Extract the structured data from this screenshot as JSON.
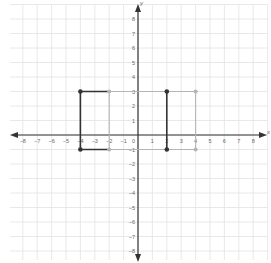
{
  "chart_data": {
    "type": "scatter",
    "title": "",
    "xlabel": "x",
    "ylabel": "y",
    "xlim": [
      -9,
      9
    ],
    "ylim": [
      -9,
      9
    ],
    "grid": true,
    "x_ticks": [
      -8,
      -7,
      -6,
      -5,
      -4,
      -3,
      -2,
      -1,
      1,
      2,
      3,
      4,
      5,
      6,
      7,
      8
    ],
    "y_ticks": [
      -8,
      -7,
      -6,
      -5,
      -4,
      -3,
      -2,
      -1,
      1,
      2,
      3,
      4,
      5,
      6,
      7,
      8
    ],
    "origin_label": "0",
    "series": [
      {
        "name": "Rectangle A (gray)",
        "style": "light",
        "color": "#b5b5b5",
        "closed": true,
        "points": [
          [
            -4,
            3
          ],
          [
            4,
            3
          ],
          [
            4,
            -1
          ],
          [
            -4,
            -1
          ]
        ]
      },
      {
        "name": "Inner vertical edge x=-2",
        "style": "light",
        "color": "#b5b5b5",
        "closed": false,
        "points": [
          [
            -2,
            3
          ],
          [
            -2,
            -1
          ]
        ]
      },
      {
        "name": "Rectangle B (dark)",
        "style": "dark",
        "color": "#333333",
        "closed": false,
        "points": [
          [
            -2,
            3
          ],
          [
            -4,
            3
          ],
          [
            -4,
            -1
          ],
          [
            -2,
            -1
          ]
        ]
      },
      {
        "name": "Dark segment x=2",
        "style": "dark",
        "color": "#333333",
        "closed": false,
        "points": [
          [
            2,
            3
          ],
          [
            2,
            -1
          ]
        ]
      }
    ],
    "dark_points": [
      [
        -4,
        3
      ],
      [
        -4,
        -1
      ],
      [
        2,
        3
      ],
      [
        2,
        -1
      ]
    ],
    "light_points": [
      [
        -2,
        3
      ],
      [
        -2,
        -1
      ],
      [
        4,
        3
      ],
      [
        4,
        -1
      ]
    ]
  },
  "axes": {
    "x_label": "x",
    "y_label": "y"
  },
  "colors": {
    "grid": "#e2e2e2",
    "axis": "#333333",
    "tick_label": "#666666",
    "dark": "#333333",
    "light": "#b5b5b5"
  }
}
